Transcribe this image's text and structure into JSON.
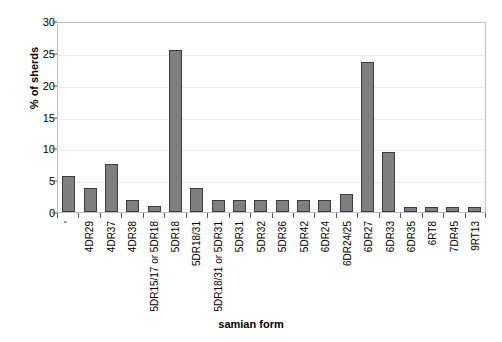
{
  "chart_data": {
    "type": "bar",
    "title": "",
    "xlabel": "samian form",
    "ylabel": "% of sherds",
    "ylim": [
      0,
      30
    ],
    "yticks": [
      0,
      5,
      10,
      15,
      20,
      25,
      30
    ],
    "grid": true,
    "legend": "none",
    "bar_color": "#7f7f7f",
    "bar_border_color": "#3d3d3d",
    "categories": [
      "'",
      "4DR29",
      "4DR37",
      "4DR38",
      "5DR15/17 or 5DR18",
      "5DR18",
      "5DR18/31",
      "5DR18/31 or 5DR31",
      "5DR31",
      "5DR32",
      "5DR36",
      "5DR42",
      "6DR24",
      "6DR24/25",
      "6DR27",
      "6DR33",
      "6DR35",
      "6RT8",
      "7DR45",
      "9RT13"
    ],
    "values": [
      5.7,
      3.8,
      7.5,
      1.9,
      0.9,
      25.5,
      3.7,
      1.9,
      1.9,
      1.9,
      1.9,
      1.9,
      1.9,
      2.8,
      23.5,
      9.4,
      0.8,
      0.8,
      0.8,
      0.8
    ]
  }
}
